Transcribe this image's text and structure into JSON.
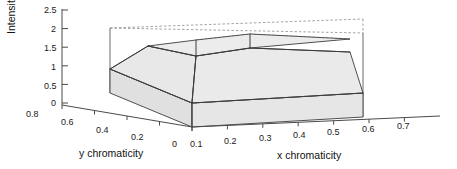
{
  "figure": {
    "name": "3d-chromaticity-intensity-surface",
    "background_color": "#ffffff",
    "line_color": "#3c3c3c",
    "fill_color": "#e6e6e6",
    "fill_color_top": "#ebebeb",
    "fill_color_side": "#e0e0e0",
    "dashed_color": "#8c8c8c"
  },
  "chart_data": {
    "type": "area",
    "title": "",
    "subtitle": "",
    "render": "3d-surface",
    "xlabel": "x chromaticity",
    "ylabel": "y chromaticity",
    "zlabel": "Intensity",
    "xlim": [
      0.0,
      0.7
    ],
    "ylim": [
      0.0,
      0.8
    ],
    "zlim": [
      0.0,
      2.5
    ],
    "xticks": [
      "0",
      "0.1",
      "0.2",
      "0.3",
      "0.4",
      "0.5",
      "0.6",
      "0.7"
    ],
    "xtick_values": [
      0,
      0.1,
      0.2,
      0.3,
      0.4,
      0.5,
      0.6,
      0.7
    ],
    "yticks": [
      "0.8",
      "0.6",
      "0.4",
      "0.2",
      "0"
    ],
    "ytick_values": [
      0.8,
      0.6,
      0.4,
      0.2,
      0
    ],
    "zticks": [
      "0",
      "0.5",
      "1",
      "1.5",
      "2",
      "2.5"
    ],
    "ztick_values": [
      0,
      0.5,
      1,
      1.5,
      2,
      2.5
    ],
    "grid": false,
    "legend": "none",
    "series": [
      {
        "name": "intensity surface",
        "description": "stepped plateau volume rising from baseline intensity 1 to an upper plateau near intensity 1.9",
        "levels": [
          {
            "label": "base plateau",
            "intensity": 1.0
          },
          {
            "label": "upper plateau",
            "intensity": 1.9
          }
        ]
      }
    ]
  },
  "labels": {
    "zticks": [
      {
        "text": "2.5",
        "x": 44,
        "y": 6
      },
      {
        "text": "2",
        "x": 51,
        "y": 25
      },
      {
        "text": "1.5",
        "x": 44,
        "y": 44
      },
      {
        "text": "1",
        "x": 51,
        "y": 63
      },
      {
        "text": "0.5",
        "x": 44,
        "y": 82
      },
      {
        "text": "0",
        "x": 51,
        "y": 99
      }
    ],
    "yticks": [
      {
        "text": "0.8",
        "x": 26,
        "y": 110
      },
      {
        "text": "0.6",
        "x": 61,
        "y": 118
      },
      {
        "text": "0.4",
        "x": 96,
        "y": 126
      },
      {
        "text": "0.2",
        "x": 131,
        "y": 133
      },
      {
        "text": "0",
        "x": 172,
        "y": 140
      }
    ],
    "xticks": [
      {
        "text": "0.1",
        "x": 190,
        "y": 140
      },
      {
        "text": "0.2",
        "x": 224,
        "y": 137
      },
      {
        "text": "0.3",
        "x": 259,
        "y": 134
      },
      {
        "text": "0.4",
        "x": 293,
        "y": 131
      },
      {
        "text": "0.5",
        "x": 327,
        "y": 128
      },
      {
        "text": "0.6",
        "x": 362,
        "y": 125
      },
      {
        "text": "0.7",
        "x": 397,
        "y": 122
      }
    ]
  }
}
